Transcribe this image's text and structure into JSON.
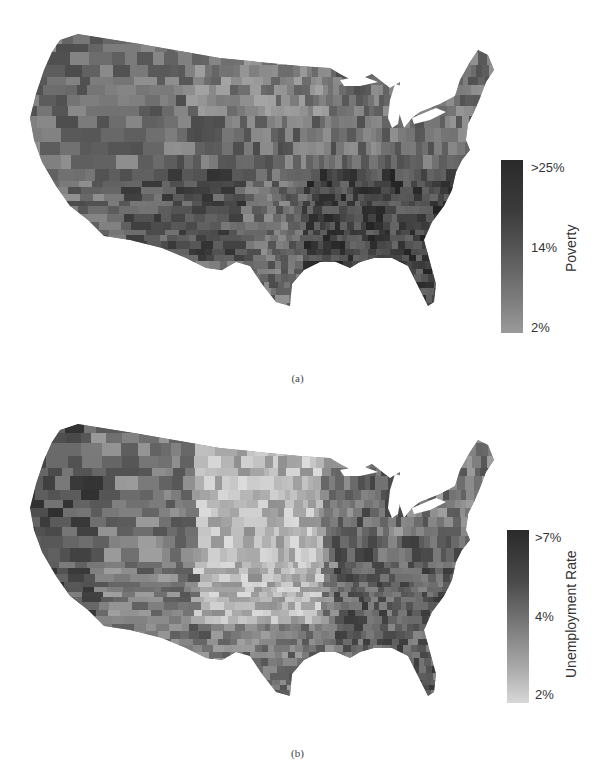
{
  "chart_data": [
    {
      "type": "heatmap",
      "subtype": "choropleth",
      "region": "Contiguous United States (county level)",
      "title": "",
      "caption": "(a)",
      "variable": "Poverty",
      "colorbar": {
        "label": "Poverty",
        "ticks": [
          ">25%",
          "14%",
          "2%"
        ],
        "tick_values": [
          25,
          14,
          2
        ],
        "range": [
          2,
          25
        ],
        "colormap": "grayscale (light = low, dark = high)",
        "color_low": "#9a9a9a",
        "color_high": "#2a2a2a"
      },
      "observations": "Highest poverty concentrated in the Southeast (Mississippi Delta, Appalachia), the Southwest border region, and scattered western reservations; lower values in the northern Plains and Northeast."
    },
    {
      "type": "heatmap",
      "subtype": "choropleth",
      "region": "Contiguous United States (county level)",
      "title": "",
      "caption": "(b)",
      "variable": "Unemployment Rate",
      "colorbar": {
        "label": "Unemployment Rate",
        "ticks": [
          ">7%",
          "4%",
          "2%"
        ],
        "tick_values": [
          7,
          4,
          2
        ],
        "range": [
          2,
          7
        ],
        "colormap": "grayscale (light = low, dark = high)",
        "color_low": "#d8d8d8",
        "color_high": "#2a2a2a"
      },
      "observations": "Lowest unemployment in the Great Plains (Dakotas, Nebraska, Kansas); highest along the Pacific coast, Southwest, Mississippi Delta, Appalachia and Michigan."
    }
  ],
  "panels": {
    "a": {
      "caption": "(a)",
      "colorbar_label": "Poverty",
      "ticks": {
        "top": ">25%",
        "mid": "14%",
        "bottom": "2%"
      }
    },
    "b": {
      "caption": "(b)",
      "colorbar_label": "Unemployment Rate",
      "ticks": {
        "top": ">7%",
        "mid": "4%",
        "bottom": "2%"
      }
    }
  },
  "colors": {
    "background": "#ffffff",
    "text": "#333333",
    "poverty_scale": [
      "#9a9a9a",
      "#6e6e6e",
      "#4a4a4a",
      "#2a2a2a"
    ],
    "unemployment_scale": [
      "#d8d8d8",
      "#a0a0a0",
      "#6a6a6a",
      "#2a2a2a"
    ]
  }
}
